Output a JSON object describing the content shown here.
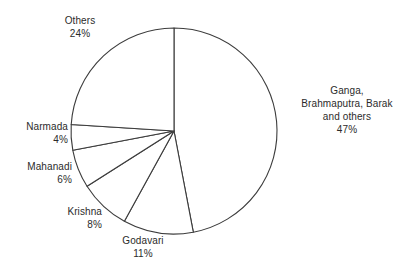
{
  "chart_data": {
    "type": "pie",
    "title": "",
    "subtitle": "",
    "xlabel": "",
    "ylabel": "",
    "grid": false,
    "legend_position": "none",
    "label_format": "name above percentage",
    "start_angle_deg": 0,
    "direction": "clockwise",
    "categories": [
      "Ganga, Brahmaputra, Barak and others",
      "Godavari",
      "Krishna",
      "Mahanadi",
      "Narmada",
      "Others"
    ],
    "values": [
      47,
      11,
      8,
      6,
      4,
      24
    ],
    "unit": "%",
    "slices": [
      {
        "name": "Ganga, Brahmaputra, Barak and others",
        "name_lines": [
          "Ganga,",
          "Brahmaputra, Barak",
          "and others"
        ],
        "value": 47,
        "value_label": "47%",
        "start_deg": 0,
        "end_deg": 169.2,
        "fill": "#ffffff",
        "stroke": "#3c3c3c"
      },
      {
        "name": "Godavari",
        "name_lines": [
          "Godavari"
        ],
        "value": 11,
        "value_label": "11%",
        "start_deg": 169.2,
        "end_deg": 208.8,
        "fill": "#ffffff",
        "stroke": "#3c3c3c"
      },
      {
        "name": "Krishna",
        "name_lines": [
          "Krishna"
        ],
        "value": 8,
        "value_label": "8%",
        "start_deg": 208.8,
        "end_deg": 237.6,
        "fill": "#ffffff",
        "stroke": "#3c3c3c"
      },
      {
        "name": "Mahanadi",
        "name_lines": [
          "Mahanadi"
        ],
        "value": 6,
        "value_label": "6%",
        "start_deg": 237.6,
        "end_deg": 259.2,
        "fill": "#ffffff",
        "stroke": "#3c3c3c"
      },
      {
        "name": "Narmada",
        "name_lines": [
          "Narmada"
        ],
        "value": 4,
        "value_label": "4%",
        "start_deg": 259.2,
        "end_deg": 273.6,
        "fill": "#ffffff",
        "stroke": "#3c3c3c"
      },
      {
        "name": "Others",
        "name_lines": [
          "Others"
        ],
        "value": 24,
        "value_label": "24%",
        "start_deg": 273.6,
        "end_deg": 360,
        "fill": "#ffffff",
        "stroke": "#3c3c3c"
      }
    ]
  },
  "labels": {
    "others": {
      "name": "Others",
      "value": "24%"
    },
    "ganga": {
      "line1": "Ganga,",
      "line2": "Brahmaputra, Barak",
      "line3": "and others",
      "value": "47%"
    },
    "narmada": {
      "name": "Narmada",
      "value": "4%"
    },
    "mahanadi": {
      "name": "Mahanadi",
      "value": "6%"
    },
    "krishna": {
      "name": "Krishna",
      "value": "8%"
    },
    "godavari": {
      "name": "Godavari",
      "value": "11%"
    }
  },
  "geometry": {
    "center_x": 174,
    "center_y": 131,
    "radius": 103
  },
  "colors": {
    "background": "#ffffff",
    "slice_fill": "#ffffff",
    "outline": "#3c3c3c",
    "text": "#2b2b2b"
  }
}
